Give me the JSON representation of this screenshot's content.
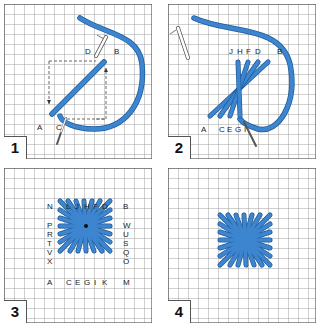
{
  "figure": {
    "thread_color": "#3d86cf",
    "thread_outline": "#1f5a9a",
    "grid_color": "#8a8a8a",
    "panels": [
      {
        "number": "1",
        "labels": {
          "D": "D",
          "B": "B",
          "A": "A",
          "C": "C"
        }
      },
      {
        "number": "2",
        "labels": {
          "J": "J",
          "H": "H",
          "F": "F",
          "D": "D",
          "B": "B",
          "A": "A",
          "C": "C",
          "E": "E",
          "G": "G",
          "I": "I"
        }
      },
      {
        "number": "3",
        "top_row": [
          "N",
          "L",
          "J",
          "H",
          "F",
          "D",
          "B"
        ],
        "left_col": [
          "P",
          "R",
          "T",
          "V",
          "X"
        ],
        "right_col": [
          "W",
          "U",
          "S",
          "Q",
          "O"
        ],
        "bottom_row": [
          "A",
          "C",
          "E",
          "G",
          "I",
          "K",
          "M"
        ]
      },
      {
        "number": "4"
      }
    ]
  }
}
